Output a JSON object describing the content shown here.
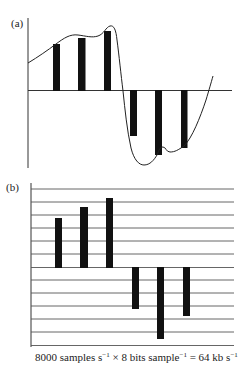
{
  "figure": {
    "panel_a": {
      "label": "(a)",
      "description": "Analog waveform sampled at regular intervals (PAM samples)",
      "bars": [
        {
          "x": 53,
          "top": 44
        },
        {
          "x": 78,
          "top": 38
        },
        {
          "x": 104,
          "top": 31
        },
        {
          "x": 130,
          "bottom": 136
        },
        {
          "x": 155,
          "bottom": 155
        },
        {
          "x": 181,
          "bottom": 148
        }
      ]
    },
    "panel_b": {
      "label": "(b)",
      "description": "Samples quantized to discrete levels",
      "quantization_levels": 13,
      "bars": [
        {
          "x": 55,
          "top": 218
        },
        {
          "x": 80,
          "top": 207
        },
        {
          "x": 106,
          "top": 198
        },
        {
          "x": 132,
          "bottom": 309
        },
        {
          "x": 157,
          "bottom": 339
        },
        {
          "x": 183,
          "bottom": 316
        }
      ]
    },
    "caption": {
      "part1": "8000 samples s",
      "sup1": "−1",
      "part2": " × 8 bits sample",
      "sup2": "−1",
      "part3": " = 64 kb s",
      "sup3": "−1"
    },
    "colors": {
      "ink": "#111111",
      "line": "#555555",
      "background": "#ffffff"
    }
  }
}
